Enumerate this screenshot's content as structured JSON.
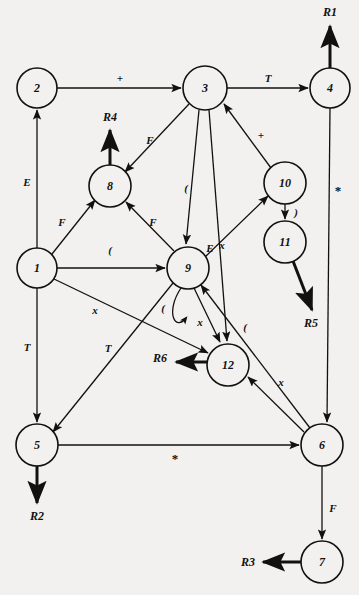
{
  "diagram": {
    "background_color": "#f2f1ef",
    "stroke_color": "#111111",
    "nodes": [
      {
        "id": "1",
        "label": "1",
        "cx": 37,
        "cy": 268,
        "r": 20
      },
      {
        "id": "2",
        "label": "2",
        "cx": 37,
        "cy": 88,
        "r": 20
      },
      {
        "id": "3",
        "label": "3",
        "cx": 205,
        "cy": 88,
        "r": 22
      },
      {
        "id": "4",
        "label": "4",
        "cx": 330,
        "cy": 88,
        "r": 20
      },
      {
        "id": "5",
        "label": "5",
        "cx": 37,
        "cy": 445,
        "r": 21
      },
      {
        "id": "6",
        "label": "6",
        "cx": 322,
        "cy": 445,
        "r": 21
      },
      {
        "id": "7",
        "label": "7",
        "cx": 322,
        "cy": 562,
        "r": 21
      },
      {
        "id": "8",
        "label": "8",
        "cx": 110,
        "cy": 186,
        "r": 21
      },
      {
        "id": "9",
        "label": "9",
        "cx": 188,
        "cy": 268,
        "r": 21
      },
      {
        "id": "10",
        "label": "10",
        "cx": 285,
        "cy": 183,
        "r": 21
      },
      {
        "id": "11",
        "label": "11",
        "cx": 285,
        "cy": 242,
        "r": 21
      },
      {
        "id": "12",
        "label": "12",
        "cx": 228,
        "cy": 365,
        "r": 21
      }
    ],
    "reduce_outputs": [
      {
        "id": "R1",
        "label": "R1",
        "x": 330,
        "y": 12
      },
      {
        "id": "R2",
        "label": "R2",
        "x": 37,
        "y": 516
      },
      {
        "id": "R3",
        "label": "R3",
        "x": 248,
        "y": 562
      },
      {
        "id": "R4",
        "label": "R4",
        "x": 110,
        "y": 117
      },
      {
        "id": "R5",
        "label": "R5",
        "x": 311,
        "y": 323
      },
      {
        "id": "R6",
        "label": "R6",
        "x": 160,
        "y": 358
      }
    ],
    "edges": [
      {
        "from": "2",
        "to": "3",
        "label": "+",
        "lx": 120,
        "ly": 78
      },
      {
        "from": "3",
        "to": "4",
        "label": "T",
        "lx": 268,
        "ly": 78
      },
      {
        "from": "1",
        "to": "2",
        "label": "E",
        "lx": 27,
        "ly": 182
      },
      {
        "from": "1",
        "to": "8",
        "label": "F",
        "lx": 62,
        "ly": 222
      },
      {
        "from": "1",
        "to": "9",
        "label": "(",
        "lx": 110,
        "ly": 250
      },
      {
        "from": "1",
        "to": "12",
        "label": "x",
        "lx": 95,
        "ly": 310
      },
      {
        "from": "1",
        "to": "5",
        "label": "T",
        "lx": 27,
        "ly": 347
      },
      {
        "from": "3",
        "to": "8",
        "label": "F",
        "lx": 150,
        "ly": 140
      },
      {
        "from": "3",
        "to": "9",
        "label": "(",
        "lx": 186,
        "ly": 188
      },
      {
        "from": "3",
        "to": "12",
        "label": "E",
        "lx": 210,
        "ly": 248
      },
      {
        "from": "9",
        "to": "8",
        "label": "F",
        "lx": 153,
        "ly": 222
      },
      {
        "from": "9",
        "to": "9",
        "label": "x",
        "lx": 200,
        "ly": 322
      },
      {
        "from": "9",
        "to": "9",
        "label": "(",
        "lx": 163,
        "ly": 308
      },
      {
        "from": "9",
        "to": "10",
        "label": "",
        "lx": 0,
        "ly": 0
      },
      {
        "from": "9",
        "to": "12",
        "label": "",
        "lx": 0,
        "ly": 0
      },
      {
        "from": "9",
        "to": "5",
        "label": "T",
        "lx": 108,
        "ly": 348
      },
      {
        "from": "10",
        "to": "3",
        "label": "+",
        "lx": 261,
        "ly": 135
      },
      {
        "from": "10",
        "to": "11",
        "label": ")",
        "lx": 296,
        "ly": 212
      },
      {
        "from": "11",
        "to": "R5",
        "label": "",
        "lx": 0,
        "ly": 0
      },
      {
        "from": "4",
        "to": "6",
        "label": "*",
        "lx": 338,
        "ly": 190
      },
      {
        "from": "5",
        "to": "6",
        "label": "*",
        "lx": 175,
        "ly": 458
      },
      {
        "from": "6",
        "to": "12",
        "label": "x",
        "lx": 281,
        "ly": 382
      },
      {
        "from": "6",
        "to": "9",
        "label": "(",
        "lx": 245,
        "ly": 327
      },
      {
        "from": "6",
        "to": "7",
        "label": "F",
        "lx": 333,
        "ly": 508
      },
      {
        "from": "12",
        "to": "R6",
        "label": "",
        "lx": 0,
        "ly": 0
      },
      {
        "from": "8",
        "to": "R4",
        "label": "",
        "lx": 0,
        "ly": 0
      },
      {
        "from": "4",
        "to": "R1",
        "label": "",
        "lx": 0,
        "ly": 0
      },
      {
        "from": "5",
        "to": "R2",
        "label": "",
        "lx": 0,
        "ly": 0
      },
      {
        "from": "7",
        "to": "R3",
        "label": "",
        "lx": 0,
        "ly": 0
      }
    ],
    "extra_marks": [
      {
        "id": "x-near-9",
        "label": "x",
        "x": 222,
        "y": 245
      }
    ]
  }
}
